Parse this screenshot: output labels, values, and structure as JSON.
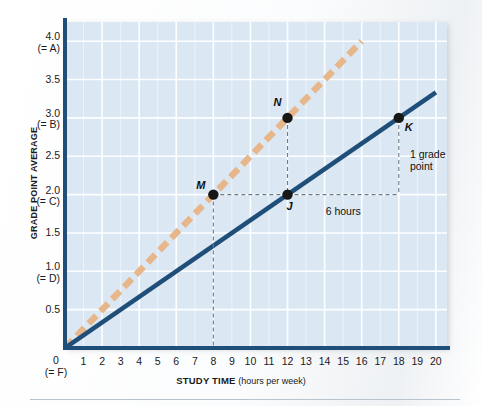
{
  "chart_data": {
    "type": "line",
    "title": "",
    "xlabel": "STUDY TIME",
    "xlabel_unit": "(hours per week)",
    "ylabel": "GRADE POINT AVERAGE",
    "xlim": [
      0,
      20.6
    ],
    "ylim": [
      0,
      4.25
    ],
    "grid": true,
    "legend": "none",
    "x_ticks": [
      "1",
      "2",
      "3",
      "4",
      "5",
      "6",
      "7",
      "8",
      "9",
      "10",
      "11",
      "12",
      "13",
      "14",
      "15",
      "16",
      "17",
      "18",
      "19",
      "20"
    ],
    "x_tick_values": [
      1,
      2,
      3,
      4,
      5,
      6,
      7,
      8,
      9,
      10,
      11,
      12,
      13,
      14,
      15,
      16,
      17,
      18,
      19,
      20
    ],
    "x_origin_label": "0",
    "x_origin_grade": "(= F)",
    "y_ticks": [
      {
        "value": 4.0,
        "label": "4.0",
        "grade": "(= A)"
      },
      {
        "value": 3.5,
        "label": "3.5",
        "grade": ""
      },
      {
        "value": 3.0,
        "label": "3.0",
        "grade": "(= B)"
      },
      {
        "value": 2.5,
        "label": "2.5",
        "grade": ""
      },
      {
        "value": 2.0,
        "label": "2.0",
        "grade": "(= C)"
      },
      {
        "value": 1.5,
        "label": "1.5",
        "grade": ""
      },
      {
        "value": 1.0,
        "label": "1.0",
        "grade": "(= D)"
      },
      {
        "value": 0.5,
        "label": "0.5",
        "grade": ""
      },
      {
        "value": 0.0,
        "label": "0",
        "grade": "(= F)"
      }
    ],
    "series": [
      {
        "name": "steeper-line",
        "style": "dashed",
        "color": "#e7b68a",
        "x": [
          0,
          16
        ],
        "y": [
          0,
          4.0
        ],
        "slope": 0.25
      },
      {
        "name": "flatter-line",
        "style": "solid",
        "color": "#1f4e79",
        "x": [
          0,
          20
        ],
        "y": [
          0,
          3.333
        ],
        "slope": 0.1667
      }
    ],
    "points": [
      {
        "label": "M",
        "x": 8,
        "y": 2.0,
        "on": "steeper-line"
      },
      {
        "label": "N",
        "x": 12,
        "y": 3.0,
        "on": "steeper-line"
      },
      {
        "label": "J",
        "x": 12,
        "y": 2.0,
        "on": "flatter-line"
      },
      {
        "label": "K",
        "x": 18,
        "y": 3.0,
        "on": "flatter-line"
      }
    ],
    "annotations": [
      {
        "name": "run-label",
        "text": "6 hours",
        "x": 15,
        "y": 1.78
      },
      {
        "name": "rise-label",
        "text": "1 grade point",
        "line1": "1 grade",
        "line2": "point",
        "x": 18.6,
        "y": 2.45
      }
    ]
  },
  "colors": {
    "plot_background": "#dbe8f4",
    "gridline": "#ffffff",
    "axis": "#1f4e79",
    "solid_line": "#1f4e79",
    "dashed_line": "#e7b68a",
    "marker": "#171717",
    "leader_line": "#6b7a86",
    "text": "#1a1a1a"
  }
}
